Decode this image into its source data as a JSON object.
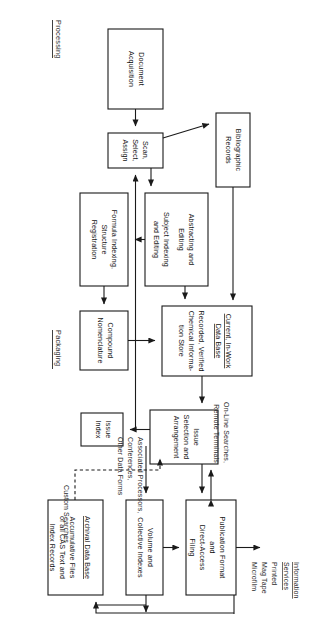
{
  "figure": {
    "orientation": "rotated-90-clockwise",
    "background_color": "#ffffff",
    "line_color": "#1a1a1a",
    "text_color": "#141414"
  },
  "sections": {
    "processing": "Processing",
    "packaging": "Packaging"
  },
  "boxes": {
    "document_acquisition": {
      "l1": "Document",
      "l2": "Acquisition"
    },
    "scan_select_assign": {
      "l1": "Scan,",
      "l2": "Select,",
      "l3": "Assign"
    },
    "bibliographic_records": {
      "l1": "Bibliographic",
      "l2": "Records"
    },
    "abstracting_editing": {
      "l1": "Abstracting and",
      "l2": "Editing",
      "l3": "Subject Indexing",
      "l4": "and Editing"
    },
    "formula_indexing": {
      "l1": "Formula Indexing,",
      "l2": "Structure",
      "l3": "Registration"
    },
    "compound_nomenclature": {
      "l1": "Compound",
      "l2": "Nomenclature"
    },
    "current_in_work_data_base": {
      "h1": "Current, In-Work",
      "h2": "Data Base",
      "l1": "Recorded, Verified",
      "l2": "Chemical Informa-",
      "l3": "tion Store"
    },
    "issue_selection": {
      "l1": "Issue",
      "l2": "Selection and",
      "l3": "Arrangement"
    },
    "issue_index": {
      "l1": "Issue",
      "l2": "Index"
    },
    "publication_format": {
      "l1": "Publication Format",
      "l2": "and",
      "l3": "Direct-Access",
      "l4": "Filing"
    },
    "volume_collective_indexes": {
      "l1": "Volume and",
      "l2": "Collective Indexes"
    },
    "archival_data_base": {
      "h1": "Archival Data Base",
      "l1": "Accumulative Files",
      "l2": "of all CAS Text and",
      "l3": "Index Records"
    }
  },
  "annotations": {
    "associated_processors": {
      "l1": "Associated Processors,",
      "l2": "Conferences,",
      "l3": "Other Data Forms"
    },
    "custom_searches": {
      "l1": "Custom Searches"
    },
    "online_searches": {
      "l1": "On-Line Searches,",
      "l2": "Remote Terminals"
    },
    "information_services": {
      "h1": "Information",
      "h2": "Services",
      "l1": "Printed",
      "l2": "Mag Tape",
      "l3": "Microfilm"
    }
  }
}
